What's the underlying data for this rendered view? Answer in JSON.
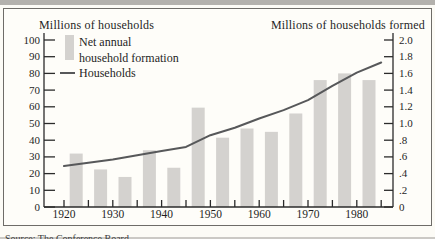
{
  "figure": {
    "left_axis_title": "Millions of households",
    "right_axis_title": "Millions of households formed",
    "legend": {
      "bar_label_line1": "Net annual",
      "bar_label_line2": "household formation",
      "line_label": "Households"
    },
    "source_note": "Source: The Conference Board"
  },
  "colors": {
    "bar": "#d4d2cf",
    "line": "#57585a",
    "axis": "#2b2b2b",
    "text": "#1f1f1f",
    "top_rule": "#b3b1ad",
    "bottom_rule": "#cbc9c5",
    "box_border": "#6e6c68",
    "box_background": "#fefdf9",
    "page_background": "#fcfbf6"
  },
  "chart_data": {
    "type": "bar",
    "subtype": "bar-and-line-dual-axis",
    "title": "",
    "x_axis": {
      "range": [
        1920,
        1985
      ],
      "tick_interval": 5,
      "label_years": [
        1920,
        1930,
        1940,
        1950,
        1960,
        1970,
        1980
      ]
    },
    "left_axis": {
      "label": "Millions of households",
      "range": [
        0,
        100
      ],
      "tick_interval": 10
    },
    "right_axis": {
      "label": "Millions of households formed",
      "range": [
        0,
        2
      ],
      "tick_values": [
        0,
        0.2,
        0.4,
        0.6,
        0.8,
        1.0,
        1.2,
        1.4,
        1.6,
        1.8,
        2.0
      ],
      "tick_labels": [
        "0",
        ".2",
        ".4",
        ".6",
        ".8",
        "1.0",
        "1.2",
        "1.4",
        "1.6",
        "1.8",
        "2.0"
      ]
    },
    "series": [
      {
        "name": "Net annual household formation",
        "type": "bar",
        "axis": "right",
        "x": [
          1922.5,
          1927.5,
          1932.5,
          1937.5,
          1942.5,
          1947.5,
          1952.5,
          1957.5,
          1962.5,
          1967.5,
          1972.5,
          1977.5,
          1982.5
        ],
        "values": [
          0.64,
          0.45,
          0.36,
          0.68,
          0.47,
          1.19,
          0.83,
          0.94,
          0.9,
          1.12,
          1.52,
          1.6,
          1.52
        ]
      },
      {
        "name": "Households",
        "type": "line",
        "axis": "left",
        "x": [
          1920,
          1925,
          1930,
          1935,
          1940,
          1945,
          1950,
          1955,
          1960,
          1965,
          1970,
          1975,
          1980,
          1985
        ],
        "values": [
          24.5,
          26.5,
          28.5,
          31,
          33.5,
          36,
          43,
          47.5,
          53,
          58,
          64,
          72.5,
          80.5,
          86.5
        ]
      }
    ]
  }
}
